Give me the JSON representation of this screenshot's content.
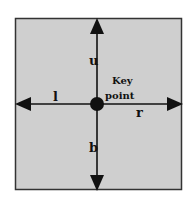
{
  "diagram": {
    "background_color": "#cfcfcf",
    "border_color": "#333333",
    "line_color": "#111111",
    "center_label_line1": "Key",
    "center_label_line2": "point",
    "directions": {
      "up": "u",
      "left": "l",
      "right": "r",
      "bottom": "b"
    }
  }
}
